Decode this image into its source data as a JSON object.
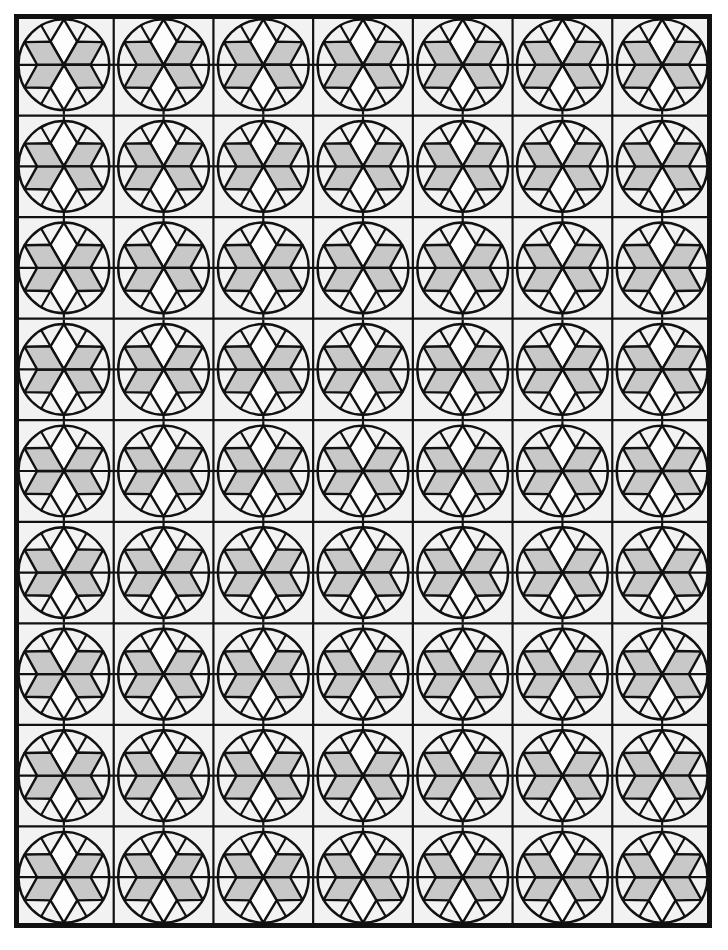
{
  "figure": {
    "canvas": {
      "width": 728,
      "height": 950
    },
    "background_color": "#ffffff"
  },
  "grid": {
    "columns": 7,
    "rows": 9,
    "x0": 14,
    "y0": 14,
    "x1": 712,
    "y1": 928,
    "cell_width": 99.714,
    "cell_height": 101.556,
    "outer_border_width": 5,
    "inner_line_width": 2.2,
    "cell_background": "#f2f2f2",
    "line_color": "#111111"
  },
  "tile": {
    "name": "six-petal-rosette",
    "circle": {
      "radius_ratio": 0.455,
      "stroke_width": 2.4,
      "stroke_color": "#111111",
      "fill": "none"
    },
    "rosette": {
      "petal_count": 6,
      "outer_ratio": 0.455,
      "mid_ratio": 0.268,
      "rhombus_half_angle_deg": 30,
      "rotation_offset_deg": -90,
      "stroke_width": 2.4,
      "stroke_color": "#111111",
      "fill_shaded": "#c8c8c8",
      "fill_plain": "#fdfdfd",
      "shading_sequence": [
        "plain",
        "shaded",
        "shaded",
        "plain",
        "shaded",
        "shaded"
      ],
      "petal_labels": [
        "petal-top",
        "petal-upper-right",
        "petal-lower-right",
        "petal-bottom",
        "petal-lower-left",
        "petal-upper-left"
      ]
    },
    "spokes": {
      "count": 6,
      "description": "radial lines from rhombus outer vertices to circle, plus cardinal connectors at cell edges",
      "stroke_width": 2.2,
      "stroke_color": "#111111"
    },
    "edge_connectors": {
      "count": 4,
      "positions": [
        "top",
        "right",
        "bottom",
        "left"
      ],
      "length": 9,
      "stroke_width": 2.2,
      "stroke_color": "#111111"
    }
  },
  "watermark": {
    "text": "",
    "visible": false
  },
  "chart_data": {
    "type": "table",
    "xlabel": "",
    "ylabel": "",
    "categories": [
      "columns",
      "rows",
      "tiles",
      "petals_per_tile",
      "shaded_per_tile",
      "plain_per_tile"
    ],
    "values": [
      7,
      9,
      63,
      6,
      4,
      2
    ]
  }
}
